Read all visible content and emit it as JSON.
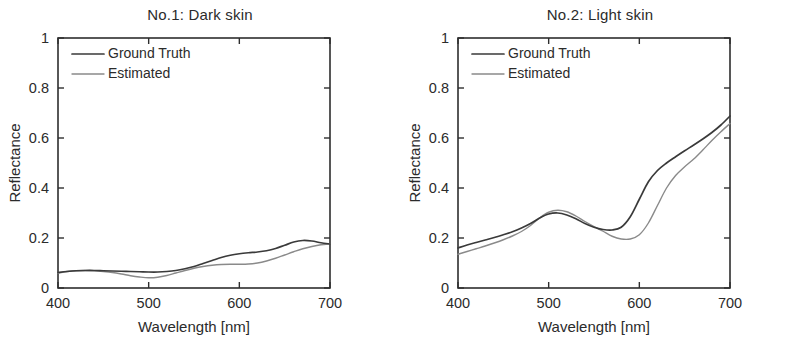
{
  "figure": {
    "background_color": "#ffffff",
    "text_color": "#2b2b2b"
  },
  "chart_data": [
    {
      "type": "line",
      "title": "No.1: Dark skin",
      "xlabel": "Wavelength [nm]",
      "ylabel": "Reflectance",
      "xlim": [
        400,
        700
      ],
      "ylim": [
        0,
        1
      ],
      "xticks": [
        400,
        500,
        600,
        700
      ],
      "xtick_labels": [
        "400",
        "500",
        "600",
        "700"
      ],
      "yticks": [
        0,
        0.2,
        0.4,
        0.6,
        0.8,
        1
      ],
      "ytick_labels": [
        "0",
        "0.2",
        "0.4",
        "0.6",
        "0.8",
        "1"
      ],
      "grid": false,
      "legend_position": "upper left",
      "x": [
        400,
        410,
        420,
        430,
        440,
        450,
        460,
        470,
        480,
        490,
        500,
        510,
        520,
        530,
        540,
        550,
        560,
        570,
        580,
        590,
        600,
        610,
        620,
        630,
        640,
        650,
        660,
        670,
        680,
        690,
        700
      ],
      "series": [
        {
          "name": "Ground Truth",
          "color": "#3a3a3a",
          "width": 1.7,
          "values": [
            0.062,
            0.066,
            0.069,
            0.07,
            0.07,
            0.069,
            0.068,
            0.067,
            0.066,
            0.065,
            0.064,
            0.064,
            0.066,
            0.07,
            0.077,
            0.086,
            0.098,
            0.11,
            0.122,
            0.131,
            0.137,
            0.141,
            0.144,
            0.149,
            0.158,
            0.171,
            0.184,
            0.19,
            0.188,
            0.181,
            0.176
          ]
        },
        {
          "name": "Estimated",
          "color": "#8a8a8a",
          "width": 1.4,
          "values": [
            0.06,
            0.066,
            0.069,
            0.07,
            0.069,
            0.066,
            0.062,
            0.056,
            0.049,
            0.044,
            0.041,
            0.043,
            0.05,
            0.06,
            0.07,
            0.079,
            0.086,
            0.091,
            0.094,
            0.095,
            0.095,
            0.096,
            0.1,
            0.108,
            0.119,
            0.132,
            0.145,
            0.157,
            0.166,
            0.173,
            0.177
          ]
        }
      ]
    },
    {
      "type": "line",
      "title": "No.2: Light skin",
      "xlabel": "Wavelength [nm]",
      "ylabel": "Reflectance",
      "xlim": [
        400,
        700
      ],
      "ylim": [
        0,
        1
      ],
      "xticks": [
        400,
        500,
        600,
        700
      ],
      "xtick_labels": [
        "400",
        "500",
        "600",
        "700"
      ],
      "yticks": [
        0,
        0.2,
        0.4,
        0.6,
        0.8,
        1
      ],
      "ytick_labels": [
        "0",
        "0.2",
        "0.4",
        "0.6",
        "0.8",
        "1"
      ],
      "grid": false,
      "legend_position": "upper left",
      "x": [
        400,
        410,
        420,
        430,
        440,
        450,
        460,
        470,
        480,
        490,
        500,
        510,
        520,
        530,
        540,
        550,
        560,
        570,
        580,
        590,
        600,
        610,
        620,
        630,
        640,
        650,
        660,
        670,
        680,
        690,
        700
      ],
      "series": [
        {
          "name": "Ground Truth",
          "color": "#3a3a3a",
          "width": 1.7,
          "values": [
            0.16,
            0.172,
            0.182,
            0.192,
            0.202,
            0.213,
            0.225,
            0.24,
            0.258,
            0.28,
            0.296,
            0.3,
            0.292,
            0.277,
            0.258,
            0.243,
            0.234,
            0.232,
            0.243,
            0.285,
            0.355,
            0.425,
            0.47,
            0.5,
            0.525,
            0.549,
            0.572,
            0.596,
            0.622,
            0.652,
            0.688
          ]
        },
        {
          "name": "Estimated",
          "color": "#8a8a8a",
          "width": 1.4,
          "values": [
            0.135,
            0.146,
            0.157,
            0.168,
            0.18,
            0.193,
            0.208,
            0.226,
            0.25,
            0.28,
            0.303,
            0.311,
            0.305,
            0.288,
            0.266,
            0.246,
            0.227,
            0.207,
            0.196,
            0.196,
            0.213,
            0.26,
            0.33,
            0.4,
            0.45,
            0.485,
            0.516,
            0.552,
            0.59,
            0.625,
            0.658
          ]
        }
      ]
    }
  ]
}
